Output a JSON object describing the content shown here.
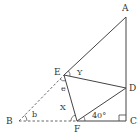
{
  "diagram": {
    "type": "geometry-figure",
    "points": {
      "A": {
        "label": "A",
        "x": 126,
        "y": 17
      },
      "B": {
        "label": "B",
        "x": 19,
        "y": 121
      },
      "C": {
        "label": "C",
        "x": 126,
        "y": 121
      },
      "D": {
        "label": "D",
        "x": 126,
        "y": 88
      },
      "E": {
        "label": "E",
        "x": 64,
        "y": 75
      },
      "F": {
        "label": "F",
        "x": 77,
        "y": 121
      }
    },
    "angle_labels": {
      "b": "b",
      "e": "e",
      "X": "X",
      "Y": "Y",
      "DFC": "40°"
    },
    "solid_segments": [
      "AE",
      "AC",
      "FC",
      "EF",
      "ED",
      "FD"
    ],
    "dashed_segments": [
      "BE",
      "BF"
    ],
    "right_angle_at": "C",
    "colors": {
      "line": "#444444",
      "text": "#333333",
      "background": "#ffffff"
    }
  }
}
